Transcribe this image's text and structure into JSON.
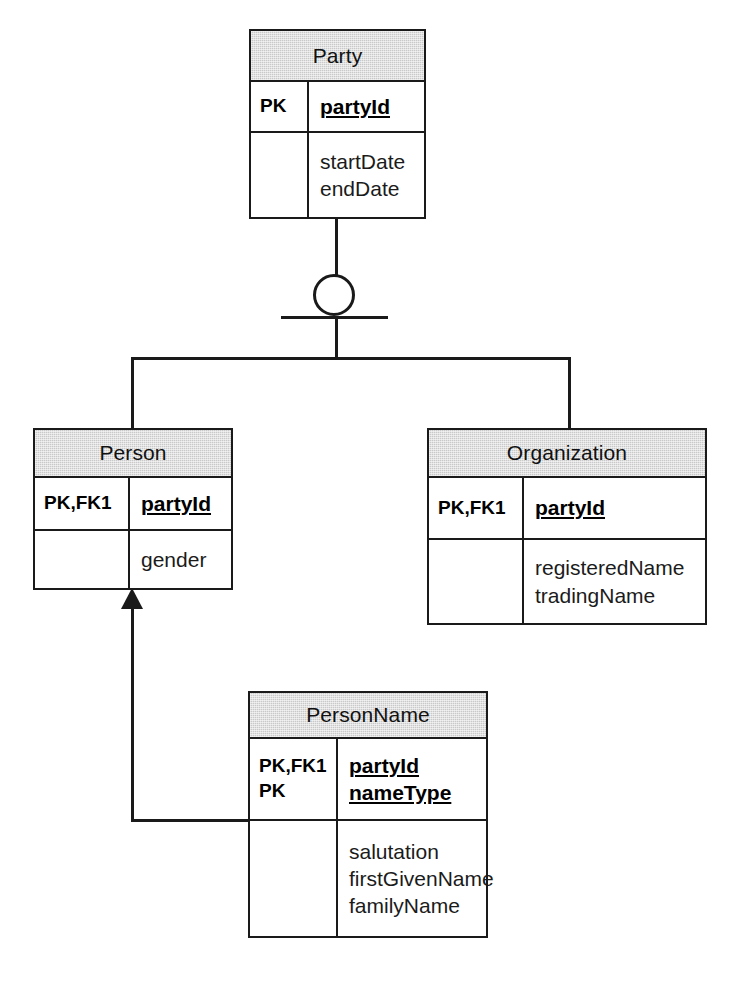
{
  "diagram": {
    "type": "entity-relationship-diagram",
    "notation": "IDEF1X / Information Engineering subtype",
    "colors": {
      "header_fill": "#c9c9c9",
      "border": "#1a1a1a",
      "background": "#ffffff",
      "text": "#000000"
    },
    "entities": [
      {
        "id": "party",
        "name": "Party",
        "key_labels": [
          "PK"
        ],
        "key_attributes": [
          "partyId"
        ],
        "attributes": [
          "startDate",
          "endDate"
        ]
      },
      {
        "id": "person",
        "name": "Person",
        "key_labels": [
          "PK,FK1"
        ],
        "key_attributes": [
          "partyId"
        ],
        "attributes": [
          "gender"
        ]
      },
      {
        "id": "organization",
        "name": "Organization",
        "key_labels": [
          "PK,FK1"
        ],
        "key_attributes": [
          "partyId"
        ],
        "attributes": [
          "registeredName",
          "tradingName"
        ]
      },
      {
        "id": "personname",
        "name": "PersonName",
        "key_labels": [
          "PK,FK1",
          "PK"
        ],
        "key_attributes": [
          "partyId",
          "nameType"
        ],
        "attributes": [
          "salutation",
          "firstGivenName",
          "familyName"
        ]
      }
    ],
    "relationships": [
      {
        "id": "party-subtypes",
        "kind": "subtype-discriminator",
        "parent": "Party",
        "children": [
          "Person",
          "Organization"
        ],
        "symbol": "circle-with-single-underline"
      },
      {
        "id": "personname-to-person",
        "kind": "identifying-foreign-key",
        "from": "PersonName",
        "to": "Person",
        "symbol": "solid-arrowhead"
      }
    ]
  }
}
